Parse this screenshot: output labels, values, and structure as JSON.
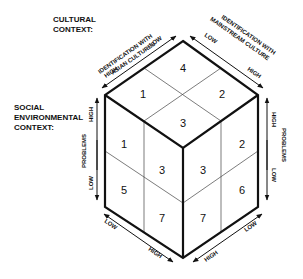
{
  "contexts": {
    "cultural": [
      "CULTURAL",
      "CONTEXT:"
    ],
    "social": [
      "SOCIAL",
      "ENVIRONMENTAL",
      "CONTEXT:"
    ]
  },
  "axes": {
    "asian": {
      "title_line1": "IDENTIFICATION WITH",
      "title_line2": "ASIAN CULTURES",
      "high": "HIGH",
      "low": "LOW"
    },
    "mainstream": {
      "title_line1": "IDENTIFICATION WITH",
      "title_line2": "MAINSTREAM CULTURE",
      "high": "HIGH",
      "low": "LOW"
    },
    "problems_left": {
      "title": "PROBLEMS",
      "high": "HIGH",
      "low": "LOW"
    },
    "problems_right": {
      "title": "PROBLEMS",
      "high": "HIGH",
      "low": "LOW"
    },
    "bottom_left": {
      "low": "LOW",
      "high": "HIGH"
    },
    "bottom_right": {
      "low": "LOW",
      "high": "HIGH"
    }
  },
  "cells": {
    "top": {
      "back": "4",
      "left": "1",
      "right": "2",
      "front": "3"
    },
    "left_face": {
      "top_left": "1",
      "top_right": "3",
      "bottom_left": "5",
      "bottom_right": "7"
    },
    "right_face": {
      "top_left": "3",
      "top_right": "2",
      "bottom_left": "7",
      "bottom_right": "6"
    }
  }
}
